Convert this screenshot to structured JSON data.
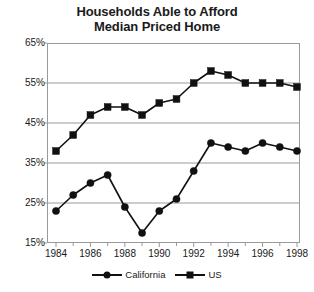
{
  "chart_data": {
    "type": "line",
    "title": "Households Able to Afford Median Priced Home",
    "title_line1": "Households Able to Afford",
    "title_line2": "Median Priced Home",
    "xlabel": "",
    "ylabel": "",
    "x": [
      1984,
      1985,
      1986,
      1987,
      1988,
      1989,
      1990,
      1991,
      1992,
      1993,
      1994,
      1995,
      1996,
      1997,
      1998
    ],
    "xlim": [
      1984,
      1998
    ],
    "ylim": [
      15,
      65
    ],
    "yticks": [
      15,
      25,
      35,
      45,
      55,
      65
    ],
    "ytick_labels": [
      "15%",
      "25%",
      "35%",
      "45%",
      "55%",
      "65%"
    ],
    "xticks": [
      1984,
      1986,
      1988,
      1990,
      1992,
      1994,
      1996,
      1998
    ],
    "xtick_labels": [
      "1984",
      "1986",
      "1988",
      "1990",
      "1992",
      "1994",
      "1996",
      "1998"
    ],
    "grid": "horizontal",
    "legend_position": "bottom",
    "series": [
      {
        "name": "California",
        "marker": "circle",
        "color": "#111111",
        "values": [
          23,
          27,
          30,
          32,
          24,
          17.5,
          23,
          26,
          33,
          40,
          39,
          38,
          40,
          39,
          38
        ]
      },
      {
        "name": "US",
        "marker": "square",
        "color": "#111111",
        "values": [
          38,
          42,
          47,
          49,
          49,
          47,
          50,
          51,
          55,
          58,
          57,
          55,
          55,
          55,
          54
        ]
      }
    ]
  },
  "legend": {
    "items": [
      {
        "label": "California",
        "marker": "circle"
      },
      {
        "label": "US",
        "marker": "square"
      }
    ]
  },
  "colors": {
    "ink": "#111111",
    "grid": "#9a9a9a",
    "background": "#ffffff"
  }
}
